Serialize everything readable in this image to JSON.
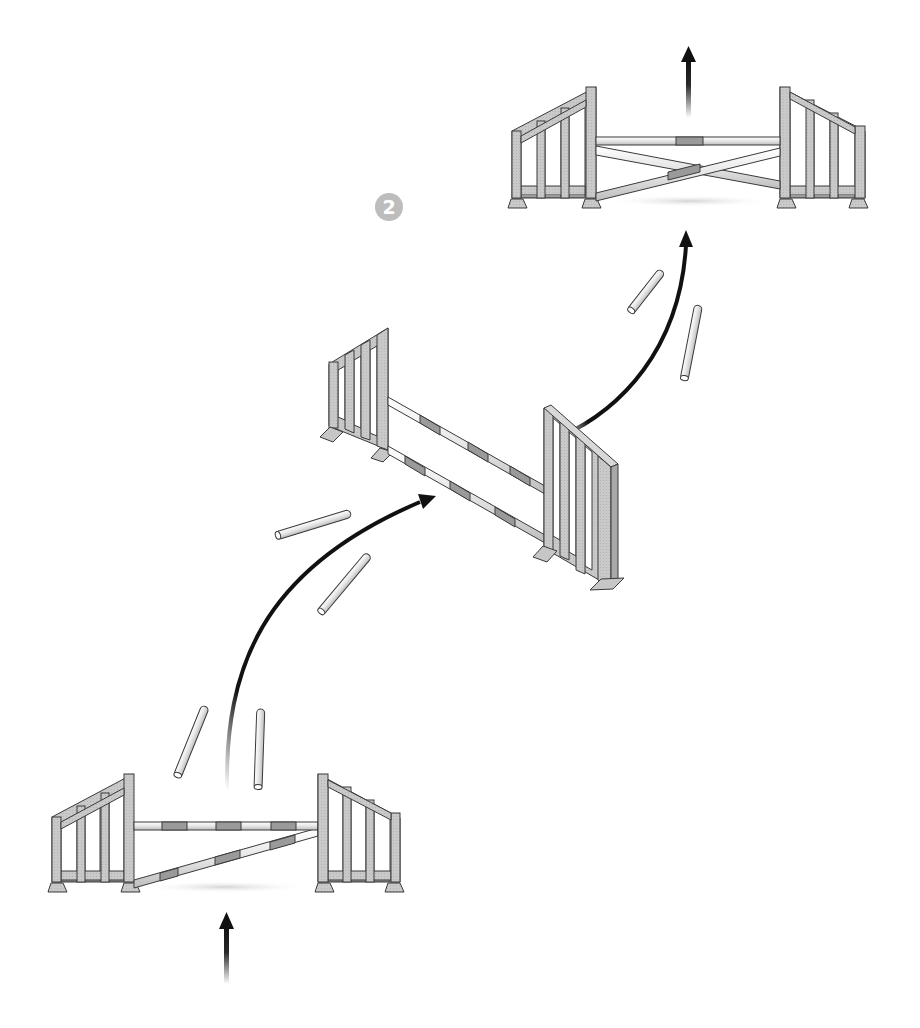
{
  "diagram": {
    "type": "show-jumping-exercise",
    "step_badge": {
      "label": "2",
      "color": "#bdbdbd",
      "text_color": "#ffffff"
    },
    "colors": {
      "background": "#ffffff",
      "wing_fill": "#c8c8c8",
      "outline": "#3a3a3a",
      "pole_light": "#f2f2f2",
      "pole_stripe": "#9a9a9a",
      "arrow": "#111111",
      "shadow": "#d9d9d9"
    },
    "fences": [
      {
        "id": "fence-1",
        "kind": "ascending-pole-fence",
        "position": "bottom-left",
        "poles": 2
      },
      {
        "id": "fence-2",
        "kind": "vertical-diagonal-fence",
        "position": "center",
        "poles": 2
      },
      {
        "id": "fence-3",
        "kind": "cross-pole-fence",
        "position": "top-right",
        "poles": 3
      }
    ],
    "ground_poles": [
      {
        "id": "pole-a",
        "near": "fence-1"
      },
      {
        "id": "pole-b",
        "near": "fence-1"
      },
      {
        "id": "pole-c",
        "near": "fence-2-approach"
      },
      {
        "id": "pole-d",
        "near": "fence-2-approach"
      },
      {
        "id": "pole-e",
        "near": "fence-3-approach"
      },
      {
        "id": "pole-f",
        "near": "fence-3-approach"
      }
    ],
    "route_arrows": [
      {
        "id": "approach-arrow",
        "direction": "up"
      },
      {
        "id": "curve-1",
        "from": "fence-1",
        "to": "fence-2"
      },
      {
        "id": "curve-2",
        "from": "fence-2",
        "to": "fence-3"
      },
      {
        "id": "exit-arrow",
        "direction": "up"
      }
    ]
  }
}
